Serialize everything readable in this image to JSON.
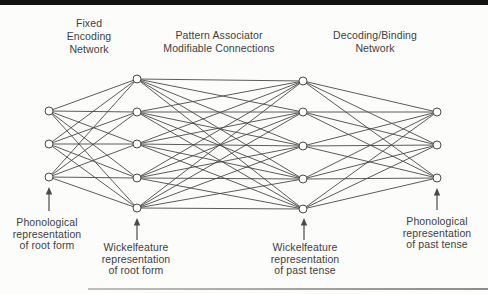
{
  "colors": {
    "paper": "#fcfcfa",
    "line": "#4a4a4a",
    "node_fill": "#ffffff",
    "node_stroke": "#4a4a4a",
    "text": "#3f3f3f",
    "top_bar": "#121212",
    "bottom_rule_left": "#bfbfbd",
    "bottom_rule_right": "#8c8c8a"
  },
  "diagram": {
    "type": "neural-network",
    "title_labels": [
      {
        "id": "fixed-encoding",
        "text": "Fixed\nEncoding\nNetwork",
        "x": 89,
        "y": 17
      },
      {
        "id": "pattern-associator",
        "text": "Pattern Associator\nModifiable Connections",
        "x": 219,
        "y": 29
      },
      {
        "id": "decoding-binding",
        "text": "Decoding/Binding\nNetwork",
        "x": 375,
        "y": 29
      }
    ],
    "io_labels": [
      {
        "id": "phonological-root",
        "text": "Phonological\nrepresentation\nof root form",
        "x": 47,
        "y": 217
      },
      {
        "id": "wickelfeature-root",
        "text": "Wickelfeature\nrepresentation\nof root form",
        "x": 136,
        "y": 242
      },
      {
        "id": "wickelfeature-past",
        "text": "Wickelfeature\nrepresentation\nof past tense",
        "x": 305,
        "y": 242
      },
      {
        "id": "phonological-past",
        "text": "Phonological\nrepresentation\nof past tense",
        "x": 437,
        "y": 216
      }
    ],
    "layers": [
      {
        "name": "phonological-root-units",
        "x": 49,
        "ys": [
          111,
          144,
          177
        ]
      },
      {
        "name": "wickelfeature-root-units",
        "x": 137,
        "ys": [
          79,
          112,
          144,
          178,
          208
        ]
      },
      {
        "name": "wickelfeature-past-units",
        "x": 303,
        "ys": [
          81,
          112,
          146,
          179,
          209
        ]
      },
      {
        "name": "phonological-past-units",
        "x": 437,
        "ys": [
          112,
          145,
          178
        ]
      }
    ],
    "connectivity": "full bipartite between consecutive layers",
    "node_radius": 4,
    "arrows": [
      {
        "x": 49,
        "tip_y": 187,
        "tail_y": 211
      },
      {
        "x": 137,
        "tip_y": 218,
        "tail_y": 240
      },
      {
        "x": 304,
        "tip_y": 218,
        "tail_y": 240
      },
      {
        "x": 437,
        "tip_y": 188,
        "tail_y": 210
      }
    ],
    "bottom_rule": {
      "left": 88,
      "top": 288,
      "width": 400
    },
    "canvas": {
      "width": 488,
      "height": 294
    }
  }
}
